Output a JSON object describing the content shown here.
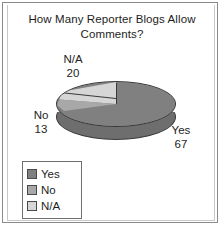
{
  "chart_data": {
    "type": "pie",
    "title": "How Many Reporter Blogs Allow Comments?",
    "xlabel": "",
    "ylabel": "",
    "three_d": true,
    "grid": false,
    "legend_position": "bottom-left",
    "categories": [
      "Yes",
      "No",
      "N/A"
    ],
    "values": [
      67,
      13,
      20
    ],
    "slices": [
      {
        "label": "Yes",
        "value": 67,
        "color": "#808080"
      },
      {
        "label": "No",
        "value": 13,
        "color": "#a8a8a8"
      },
      {
        "label": "N/A",
        "value": 20,
        "color": "#d6d6d6"
      }
    ],
    "annotations": [
      {
        "name": "N/A",
        "value": 20
      },
      {
        "name": "No",
        "value": 13
      },
      {
        "name": "Yes",
        "value": 67
      }
    ]
  },
  "legend": {
    "items": [
      {
        "label": "Yes",
        "color": "#808080"
      },
      {
        "label": "No",
        "color": "#a8a8a8"
      },
      {
        "label": "N/A",
        "color": "#d6d6d6"
      }
    ]
  },
  "colors": {
    "slice_yes": "#808080",
    "slice_no": "#a8a8a8",
    "slice_na": "#d6d6d6",
    "pie_side": "#6e6e6e",
    "outline": "#3a3a3a",
    "frame": "#8a8a8a",
    "text": "#1d1d1d",
    "background": "#ffffff"
  }
}
